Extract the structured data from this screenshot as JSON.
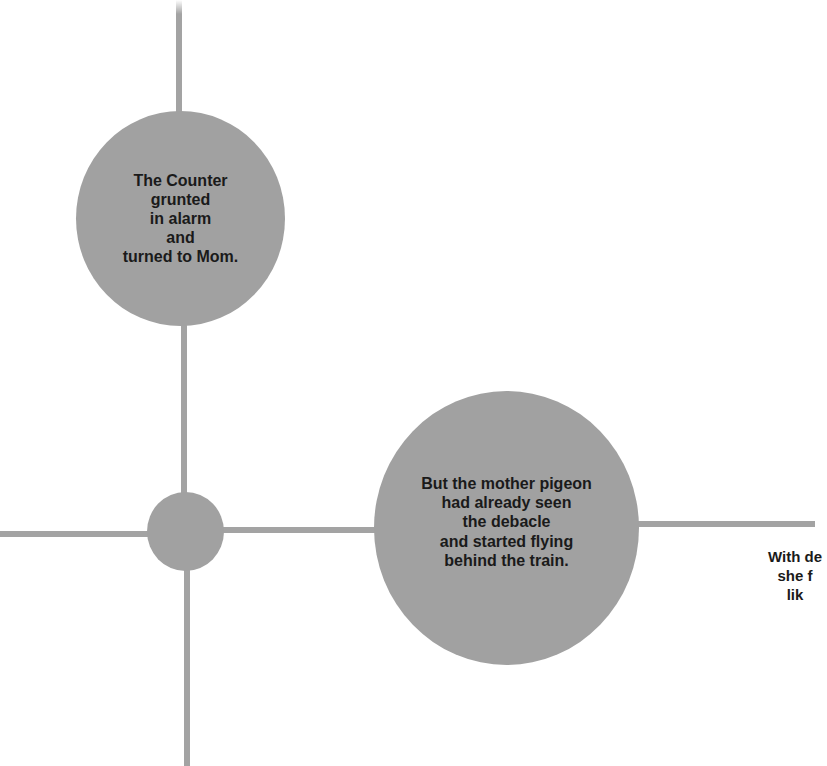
{
  "diagram": {
    "background": "#ffffff",
    "node_color": "#a1a1a1",
    "line_color": "#a3a3a3",
    "text_color": "#1a1a1a",
    "nodes": [
      {
        "id": "node-counter",
        "text": "The Counter\ngrunted\nin alarm\nand\nturned to Mom."
      },
      {
        "id": "node-junction",
        "text": ""
      },
      {
        "id": "node-pigeon",
        "text": "But the mother pigeon\nhad already seen\nthe debacle\nand started flying\nbehind the train."
      }
    ],
    "cropped_text": "With de\nshe f\nlik"
  }
}
